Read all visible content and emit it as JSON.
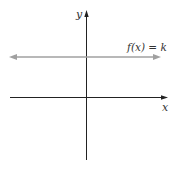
{
  "diagram": {
    "type": "coordinate-plane",
    "axes": {
      "x_label": "x",
      "y_label": "y"
    },
    "function": {
      "label": "f(x) = k",
      "description": "horizontal constant function line above the x-axis",
      "color": "#a0a0a0"
    },
    "colors": {
      "axis": "#222222",
      "background": "#ffffff"
    }
  }
}
